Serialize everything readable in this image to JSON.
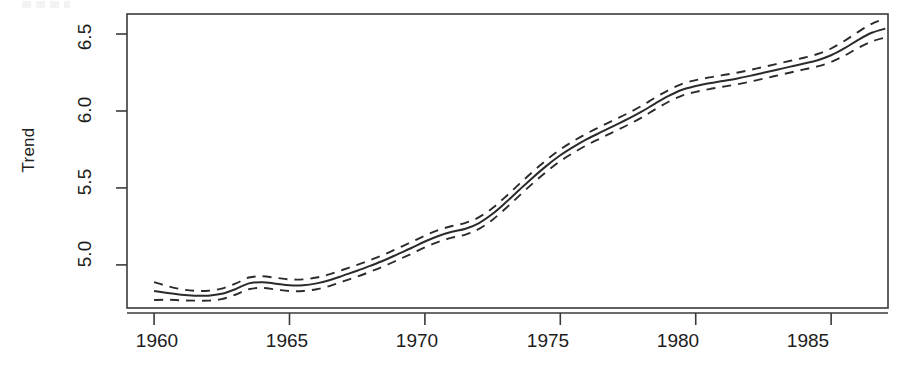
{
  "figure": {
    "background_color": "#ffffff",
    "line_color": "#2b2b2b",
    "artifact_name": "scan-artifact-top-left"
  },
  "chart_data": {
    "type": "line",
    "title": "",
    "subtitle": "",
    "xlabel": "",
    "ylabel": "Trend",
    "xlim": [
      1959.0,
      1987.1
    ],
    "ylim": [
      4.72,
      6.63
    ],
    "xticks": [
      1960,
      1965,
      1970,
      1975,
      1980,
      1985
    ],
    "xticklabels": [
      "1960",
      "1965",
      "1970",
      "1975",
      "1980",
      "1985"
    ],
    "yticks": [
      5.0,
      5.5,
      6.0,
      6.5
    ],
    "yticklabels": [
      "5.0",
      "5.5",
      "6.0",
      "6.5"
    ],
    "grid": false,
    "legend": null,
    "box": true,
    "annotations": [],
    "x": [
      1960.0,
      1960.5,
      1961.0,
      1961.5,
      1962.0,
      1962.5,
      1963.0,
      1963.5,
      1964.0,
      1964.5,
      1965.0,
      1965.5,
      1966.0,
      1966.5,
      1967.0,
      1967.5,
      1968.0,
      1968.5,
      1969.0,
      1969.5,
      1970.0,
      1970.5,
      1971.0,
      1971.5,
      1972.0,
      1972.5,
      1973.0,
      1973.5,
      1974.0,
      1974.5,
      1975.0,
      1975.5,
      1976.0,
      1976.5,
      1977.0,
      1977.5,
      1978.0,
      1978.5,
      1979.0,
      1979.5,
      1980.0,
      1980.5,
      1981.0,
      1981.5,
      1982.0,
      1982.5,
      1983.0,
      1983.5,
      1984.0,
      1984.5,
      1985.0,
      1985.5,
      1986.0,
      1986.5,
      1987.0
    ],
    "series": [
      {
        "name": "Trend (fitted)",
        "style": "solid",
        "values": [
          4.83,
          4.818,
          4.806,
          4.8,
          4.8,
          4.812,
          4.842,
          4.88,
          4.888,
          4.878,
          4.868,
          4.868,
          4.88,
          4.902,
          4.932,
          4.962,
          4.995,
          5.03,
          5.07,
          5.11,
          5.152,
          5.188,
          5.215,
          5.235,
          5.272,
          5.332,
          5.408,
          5.49,
          5.57,
          5.645,
          5.712,
          5.768,
          5.818,
          5.862,
          5.905,
          5.948,
          5.995,
          6.048,
          6.098,
          6.138,
          6.162,
          6.18,
          6.195,
          6.21,
          6.228,
          6.248,
          6.268,
          6.288,
          6.308,
          6.33,
          6.362,
          6.408,
          6.462,
          6.508,
          6.535
        ]
      },
      {
        "name": "Upper confidence bound",
        "style": "dashed",
        "values": [
          4.888,
          4.862,
          4.842,
          4.832,
          4.832,
          4.846,
          4.878,
          4.918,
          4.926,
          4.916,
          4.906,
          4.906,
          4.918,
          4.94,
          4.97,
          5.0,
          5.033,
          5.068,
          5.108,
          5.148,
          5.19,
          5.226,
          5.253,
          5.273,
          5.31,
          5.37,
          5.446,
          5.528,
          5.608,
          5.683,
          5.75,
          5.806,
          5.856,
          5.9,
          5.943,
          5.986,
          6.033,
          6.086,
          6.136,
          6.176,
          6.2,
          6.218,
          6.233,
          6.248,
          6.266,
          6.286,
          6.306,
          6.326,
          6.346,
          6.37,
          6.406,
          6.456,
          6.514,
          6.566,
          6.6
        ]
      },
      {
        "name": "Lower confidence bound",
        "style": "dashed",
        "values": [
          4.772,
          4.774,
          4.77,
          4.768,
          4.768,
          4.778,
          4.806,
          4.842,
          4.85,
          4.84,
          4.83,
          4.83,
          4.842,
          4.864,
          4.894,
          4.924,
          4.957,
          4.992,
          5.032,
          5.072,
          5.114,
          5.15,
          5.177,
          5.197,
          5.234,
          5.294,
          5.37,
          5.452,
          5.532,
          5.607,
          5.674,
          5.73,
          5.78,
          5.824,
          5.867,
          5.91,
          5.957,
          6.01,
          6.06,
          6.1,
          6.124,
          6.142,
          6.157,
          6.172,
          6.19,
          6.21,
          6.23,
          6.25,
          6.27,
          6.29,
          6.318,
          6.36,
          6.41,
          6.452,
          6.478
        ]
      }
    ]
  }
}
